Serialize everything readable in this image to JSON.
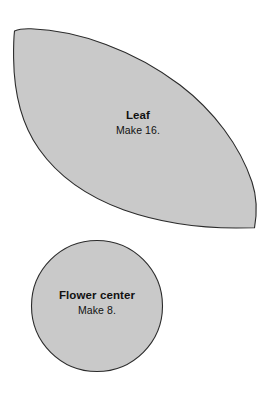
{
  "document": {
    "kind": "applique-pattern-template-sheet",
    "background_color": "#ffffff"
  },
  "style": {
    "piece_fill": "#c9c9c9",
    "piece_stroke": "#2b2b2b",
    "piece_stroke_width": 1,
    "label_color": "#111111"
  },
  "pieces": [
    {
      "id": "leaf",
      "shape": "leaf",
      "shape_icon": "leaf-shape-icon",
      "title": "Leaf",
      "quantity_text": "Make 16.",
      "quantity": 16,
      "fill": "#c9c9c9",
      "stroke": "#2b2b2b"
    },
    {
      "id": "flower-center",
      "shape": "circle",
      "shape_icon": "circle-shape-icon",
      "title": "Flower center",
      "quantity_text": "Make 8.",
      "quantity": 8,
      "fill": "#c9c9c9",
      "stroke": "#2b2b2b"
    }
  ]
}
